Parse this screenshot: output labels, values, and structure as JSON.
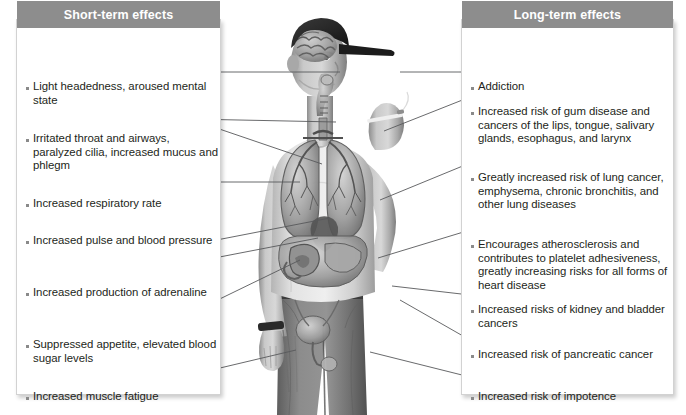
{
  "diagram": {
    "background_color": "#ffffff",
    "header_color": "#8d8d8d",
    "header_text_color": "#ffffff",
    "text_color": "#231f20",
    "bullet_color": "#8a8a8a",
    "leader_line_color": "#58595b"
  },
  "panels": {
    "short_term": {
      "header": "Short-term effects",
      "items": [
        {
          "text": "Light headedness, aroused mental state",
          "target": "brain"
        },
        {
          "text": "Irritated throat and airways, paralyzed cilia, increased mucus and phlegm",
          "target": "throat-and-airways"
        },
        {
          "text": "Increased respiratory rate",
          "target": "lungs"
        },
        {
          "text": "Increased pulse and blood pressure",
          "target": "heart"
        },
        {
          "text": "Increased production of adrenaline",
          "target": "adrenal-glands"
        },
        {
          "text": "Suppressed appetite, elevated blood sugar levels",
          "target": "stomach"
        },
        {
          "text": "Increased muscle fatigue",
          "target": "leg-muscles"
        }
      ]
    },
    "long_term": {
      "header": "Long-term effects",
      "items": [
        {
          "text": "Addiction",
          "target": "brain"
        },
        {
          "text": "Increased risk of gum disease and cancers of the lips, tongue, salivary glands, esophagus, and larynx",
          "target": "mouth-and-throat"
        },
        {
          "text": "Greatly increased risk of lung cancer, emphysema, chronic bronchitis, and other lung diseases",
          "target": "lungs"
        },
        {
          "text": "Encourages atherosclerosis and contributes to platelet adhesiveness, greatly increasing risks for all forms of heart disease",
          "target": "heart-and-arteries"
        },
        {
          "text": "Increased risks of kidney and bladder cancers",
          "target": "kidney-and-bladder"
        },
        {
          "text": "Increased risk of pancreatic cancer",
          "target": "pancreas"
        },
        {
          "text": "Increased risk of impotence",
          "target": "reproductive-organs"
        }
      ]
    }
  },
  "figure": {
    "overlays": [
      "brain",
      "throat and trachea",
      "lungs and bronchial tree",
      "heart",
      "stomach and abdominal organs",
      "bladder and reproductive organs"
    ]
  }
}
